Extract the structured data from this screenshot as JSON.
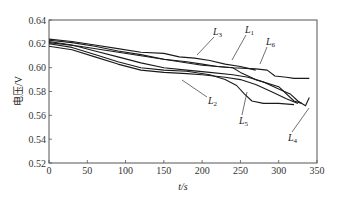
{
  "chart_data": {
    "type": "line",
    "title": "",
    "xlabel": "t/s",
    "ylabel": "电压/V",
    "xlim": [
      0,
      350
    ],
    "ylim": [
      0.52,
      0.64
    ],
    "x_ticks": [
      0,
      50,
      100,
      150,
      200,
      250,
      300,
      350
    ],
    "y_ticks": [
      0.52,
      0.54,
      0.56,
      0.58,
      0.6,
      0.62,
      0.64
    ],
    "y_tick_labels": [
      "0.52",
      "0.54",
      "0.56",
      "0.58",
      "0.60",
      "0.62",
      "0.64"
    ],
    "grid": false,
    "legend": "inline leader-line labels",
    "series": [
      {
        "name": "L1",
        "label_main": "L",
        "label_sub": "1",
        "x": [
          0,
          30,
          60,
          90,
          120,
          150,
          180,
          200,
          220,
          240,
          250,
          270,
          300,
          320,
          330
        ],
        "y": [
          0.623,
          0.621,
          0.618,
          0.614,
          0.611,
          0.607,
          0.605,
          0.603,
          0.601,
          0.6,
          0.596,
          0.59,
          0.584,
          0.572,
          0.57
        ]
      },
      {
        "name": "L2",
        "label_main": "L",
        "label_sub": "2",
        "x": [
          0,
          30,
          60,
          90,
          120,
          150,
          180,
          200,
          230,
          250,
          270,
          290,
          310,
          325
        ],
        "y": [
          0.618,
          0.615,
          0.609,
          0.603,
          0.598,
          0.596,
          0.595,
          0.594,
          0.592,
          0.59,
          0.586,
          0.58,
          0.574,
          0.57
        ]
      },
      {
        "name": "L3",
        "label_main": "L",
        "label_sub": "3",
        "x": [
          0,
          30,
          60,
          90,
          120,
          150,
          170,
          190,
          210,
          230,
          250,
          270
        ],
        "y": [
          0.624,
          0.622,
          0.619,
          0.616,
          0.613,
          0.612,
          0.609,
          0.608,
          0.606,
          0.603,
          0.601,
          0.598
        ]
      },
      {
        "name": "L4",
        "label_main": "L",
        "label_sub": "4",
        "x": [
          0,
          30,
          60,
          90,
          120,
          150,
          180,
          210,
          240,
          260,
          280,
          300,
          315,
          325,
          335,
          340
        ],
        "y": [
          0.622,
          0.619,
          0.614,
          0.609,
          0.604,
          0.6,
          0.598,
          0.596,
          0.594,
          0.592,
          0.588,
          0.582,
          0.578,
          0.572,
          0.568,
          0.575
        ]
      },
      {
        "name": "L5",
        "label_main": "L",
        "label_sub": "5",
        "x": [
          0,
          30,
          60,
          90,
          120,
          150,
          180,
          210,
          230,
          245,
          255,
          265,
          280,
          300,
          320
        ],
        "y": [
          0.62,
          0.617,
          0.611,
          0.605,
          0.6,
          0.598,
          0.597,
          0.594,
          0.59,
          0.585,
          0.578,
          0.572,
          0.57,
          0.57,
          0.569
        ]
      },
      {
        "name": "L6",
        "label_main": "L",
        "label_sub": "6",
        "x": [
          0,
          40,
          80,
          120,
          160,
          200,
          240,
          270,
          285,
          295,
          310,
          320,
          340
        ],
        "y": [
          0.621,
          0.618,
          0.614,
          0.61,
          0.606,
          0.602,
          0.6,
          0.599,
          0.598,
          0.593,
          0.592,
          0.591,
          0.591
        ]
      }
    ]
  }
}
